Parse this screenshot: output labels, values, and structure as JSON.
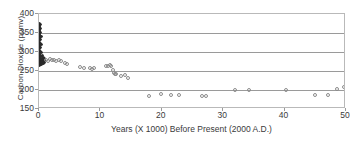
{
  "chart_data": {
    "type": "scatter",
    "title": "",
    "xlabel": "Years (X 1000) Before Present (2000 A.D.)",
    "ylabel": "Carbon Dioxide (ppmv)",
    "xlim": [
      0,
      50
    ],
    "ylim": [
      150,
      400
    ],
    "xticks": [
      0,
      10,
      20,
      30,
      40,
      50
    ],
    "yticks": [
      150,
      200,
      250,
      300,
      350,
      400
    ],
    "xtick_labels": [
      "0",
      "10",
      "20",
      "30",
      "40",
      "50"
    ],
    "ytick_labels": [
      "150",
      "200",
      "250",
      "300",
      "350",
      "400"
    ],
    "grid": "horizontal",
    "legend": "none",
    "marker": "open-circle",
    "marker_color": "#8c8c8c",
    "dense_cluster_color": "#2b2b2b",
    "frame_color": "#b9b9b9",
    "gridline_color": "#9a9a9a",
    "note": "Dense near-vertical band of modern/recent measurements at x near 0 spanning roughly 265 to 375 ppmv",
    "series": [
      {
        "name": "Ice core CO2 (dense modern cluster)",
        "points": [
          [
            0.05,
            375
          ],
          [
            0.05,
            371
          ],
          [
            0.05,
            368
          ],
          [
            0.05,
            365
          ],
          [
            0.05,
            362
          ],
          [
            0.05,
            359
          ],
          [
            0.05,
            356
          ],
          [
            0.05,
            353
          ],
          [
            0.05,
            350
          ],
          [
            0.05,
            347
          ],
          [
            0.05,
            344
          ],
          [
            0.05,
            341
          ],
          [
            0.05,
            338
          ],
          [
            0.05,
            335
          ],
          [
            0.05,
            332
          ],
          [
            0.05,
            329
          ],
          [
            0.05,
            326
          ],
          [
            0.05,
            323
          ],
          [
            0.05,
            320
          ],
          [
            0.05,
            317
          ],
          [
            0.05,
            314
          ],
          [
            0.05,
            311
          ],
          [
            0.05,
            308
          ],
          [
            0.05,
            305
          ],
          [
            0.05,
            302
          ],
          [
            0.05,
            299
          ],
          [
            0.05,
            296
          ],
          [
            0.05,
            293
          ],
          [
            0.05,
            290
          ],
          [
            0.05,
            288
          ],
          [
            0.05,
            286
          ],
          [
            0.05,
            284
          ],
          [
            0.05,
            282
          ],
          [
            0.05,
            280
          ],
          [
            0.05,
            279
          ],
          [
            0.05,
            278
          ],
          [
            0.05,
            277
          ],
          [
            0.05,
            276
          ],
          [
            0.05,
            275
          ],
          [
            0.05,
            274
          ],
          [
            0.05,
            273
          ],
          [
            0.05,
            272
          ],
          [
            0.05,
            271
          ],
          [
            0.05,
            270
          ],
          [
            0.05,
            269
          ],
          [
            0.05,
            268
          ],
          [
            0.05,
            267
          ],
          [
            0.05,
            266
          ],
          [
            0.05,
            265
          ],
          [
            0.2,
            372
          ],
          [
            0.2,
            362
          ],
          [
            0.2,
            352
          ],
          [
            0.2,
            342
          ],
          [
            0.2,
            332
          ],
          [
            0.2,
            322
          ],
          [
            0.2,
            312
          ],
          [
            0.2,
            302
          ],
          [
            0.2,
            292
          ],
          [
            0.2,
            284
          ],
          [
            0.2,
            279
          ],
          [
            0.2,
            276
          ],
          [
            0.2,
            273
          ],
          [
            0.2,
            270
          ],
          [
            0.2,
            267
          ],
          [
            0.35,
            340
          ],
          [
            0.35,
            320
          ],
          [
            0.35,
            300
          ],
          [
            0.35,
            288
          ],
          [
            0.35,
            280
          ],
          [
            0.35,
            276
          ],
          [
            0.35,
            272
          ],
          [
            0.35,
            268
          ],
          [
            0.5,
            290
          ],
          [
            0.5,
            283
          ],
          [
            0.5,
            278
          ],
          [
            0.5,
            274
          ],
          [
            0.5,
            270
          ],
          [
            0.7,
            285
          ],
          [
            0.7,
            279
          ],
          [
            0.7,
            275
          ],
          [
            0.7,
            271
          ],
          [
            0.9,
            282
          ],
          [
            0.9,
            277
          ],
          [
            0.9,
            273
          ]
        ]
      },
      {
        "name": "Ice core CO2 (open circles)",
        "points": [
          [
            1.2,
            279
          ],
          [
            1.5,
            277
          ],
          [
            1.8,
            281
          ],
          [
            2.1,
            278
          ],
          [
            2.4,
            280
          ],
          [
            2.8,
            277
          ],
          [
            3.2,
            279
          ],
          [
            3.6,
            276
          ],
          [
            4.3,
            270
          ],
          [
            4.6,
            268
          ],
          [
            6.6,
            261
          ],
          [
            7.4,
            258
          ],
          [
            8.3,
            257
          ],
          [
            8.7,
            256
          ],
          [
            9.0,
            259
          ],
          [
            10.9,
            262
          ],
          [
            11.2,
            263
          ],
          [
            11.6,
            265
          ],
          [
            11.8,
            264
          ],
          [
            12.0,
            252
          ],
          [
            12.2,
            246
          ],
          [
            12.3,
            243
          ],
          [
            12.5,
            241
          ],
          [
            13.3,
            238
          ],
          [
            14.0,
            240
          ],
          [
            14.5,
            232
          ],
          [
            17.9,
            184
          ],
          [
            19.9,
            189
          ],
          [
            21.5,
            186
          ],
          [
            22.8,
            187
          ],
          [
            26.6,
            184
          ],
          [
            27.2,
            185
          ],
          [
            31.9,
            200
          ],
          [
            34.2,
            201
          ],
          [
            40.3,
            200
          ],
          [
            44.9,
            186
          ],
          [
            47.0,
            187
          ],
          [
            48.6,
            203
          ],
          [
            49.6,
            207
          ]
        ]
      }
    ]
  },
  "axes": {
    "x_title": "Years (X 1000) Before Present (2000 A.D.)",
    "y_title": "Carbon Dioxide (ppmv)"
  }
}
